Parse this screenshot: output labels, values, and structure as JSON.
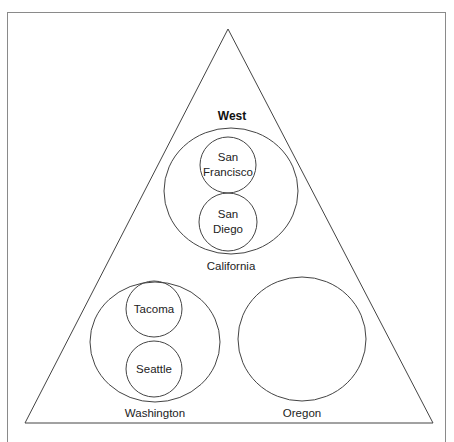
{
  "diagram": {
    "title": "West",
    "colors": {
      "stroke": "#444444",
      "frame": "#8a8a8a",
      "text": "#222222"
    },
    "states": [
      {
        "name": "California",
        "cities": [
          "San Francisco",
          "San Diego"
        ]
      },
      {
        "name": "Washington",
        "cities": [
          "Tacoma",
          "Seattle"
        ]
      },
      {
        "name": "Oregon",
        "cities": []
      }
    ],
    "labels": {
      "west": "West",
      "california": "California",
      "san_francisco_1": "San",
      "san_francisco_2": "Francisco",
      "san_diego_1": "San",
      "san_diego_2": "Diego",
      "washington": "Washington",
      "tacoma": "Tacoma",
      "seattle": "Seattle",
      "oregon": "Oregon"
    }
  }
}
